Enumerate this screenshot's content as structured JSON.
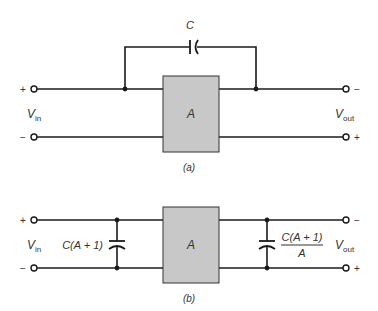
{
  "figure_a": {
    "caption": "(a)",
    "capacitor_label": "C",
    "amplifier_label": "A",
    "input_label": "V",
    "input_sub": "in",
    "output_label": "V",
    "output_sub": "out",
    "in_top_polarity": "+",
    "in_bottom_polarity": "−",
    "out_top_polarity": "−",
    "out_bottom_polarity": "+"
  },
  "figure_b": {
    "caption": "(b)",
    "amplifier_label": "A",
    "input_cap_label": "C(A + 1)",
    "output_cap_numerator": "C(A + 1)",
    "output_cap_denominator": "A",
    "input_label": "V",
    "input_sub": "in",
    "output_label": "V",
    "output_sub": "out",
    "in_top_polarity": "+",
    "in_bottom_polarity": "−",
    "out_top_polarity": "−",
    "out_bottom_polarity": "+"
  },
  "colors": {
    "amplifier_fill": "#c8c8c8",
    "line": "#1a1a1a"
  }
}
